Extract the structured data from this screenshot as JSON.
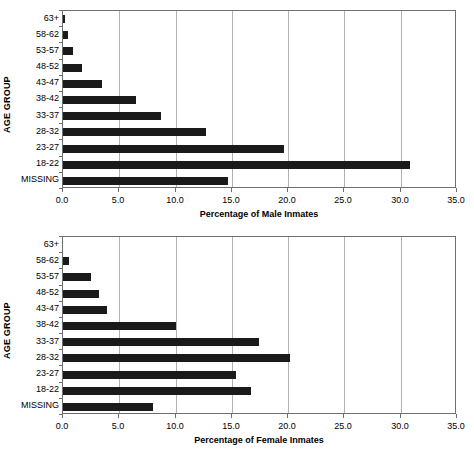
{
  "chart_data": [
    {
      "type": "bar",
      "orientation": "horizontal",
      "title": "",
      "xlabel": "Percentage of Male Inmates",
      "ylabel": "AGE GROUP",
      "xlim": [
        0,
        35
      ],
      "xticks": [
        "0.0",
        "5.0",
        "10.0",
        "15.0",
        "20.0",
        "25.0",
        "30.0",
        "35.0"
      ],
      "xtick_values": [
        0,
        5,
        10,
        15,
        20,
        25,
        30,
        35
      ],
      "grid": "vertical",
      "legend": "none",
      "bar_color": "#1a1a1a",
      "categories": [
        "63+",
        "58-62",
        "53-57",
        "48-52",
        "43-47",
        "38-42",
        "33-37",
        "28-32",
        "23-27",
        "18-22",
        "MISSING"
      ],
      "values": [
        0.2,
        0.4,
        0.9,
        1.7,
        3.5,
        6.5,
        8.7,
        12.7,
        19.6,
        30.8,
        14.7
      ]
    },
    {
      "type": "bar",
      "orientation": "horizontal",
      "title": "",
      "xlabel": "Percentage of Female Inmates",
      "ylabel": "AGE GROUP",
      "xlim": [
        0,
        35
      ],
      "xticks": [
        "0.0",
        "5.0",
        "10.0",
        "15.0",
        "20.0",
        "25.0",
        "30.0",
        "35.0"
      ],
      "xtick_values": [
        0,
        5,
        10,
        15,
        20,
        25,
        30,
        35
      ],
      "grid": "vertical",
      "legend": "none",
      "bar_color": "#1a1a1a",
      "categories": [
        "63+",
        "58-62",
        "53-57",
        "48-52",
        "43-47",
        "38-42",
        "33-37",
        "28-32",
        "23-27",
        "18-22",
        "MISSING"
      ],
      "values": [
        0.0,
        0.5,
        2.5,
        3.2,
        3.9,
        10.0,
        17.4,
        20.2,
        15.4,
        16.7,
        8.0
      ]
    }
  ]
}
